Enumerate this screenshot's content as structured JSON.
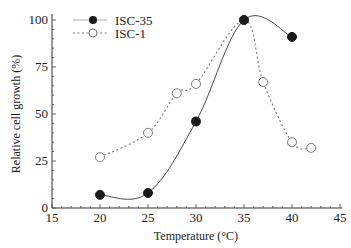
{
  "chart_data": {
    "type": "line",
    "title": "",
    "xlabel": "Temperature (°C)",
    "ylabel": "Relative cell growth (%)",
    "xlim": [
      15,
      45
    ],
    "ylim": [
      0,
      105
    ],
    "xticks": [
      15,
      20,
      25,
      30,
      35,
      40,
      45
    ],
    "yticks": [
      0,
      25,
      50,
      75,
      100
    ],
    "grid": false,
    "legend_position": "upper left",
    "series": [
      {
        "name": "ISC-35",
        "marker": "filled-circle",
        "line_style": "solid",
        "color": "#333333",
        "x": [
          20,
          25,
          30,
          35,
          40
        ],
        "values": [
          7,
          8,
          46,
          100,
          91
        ]
      },
      {
        "name": "ISC-1",
        "marker": "open-circle",
        "line_style": "dotted",
        "color": "#888888",
        "x": [
          20,
          25,
          28,
          30,
          35,
          37,
          40,
          42
        ],
        "values": [
          27,
          40,
          61,
          66,
          100,
          67,
          35,
          32
        ]
      }
    ]
  }
}
